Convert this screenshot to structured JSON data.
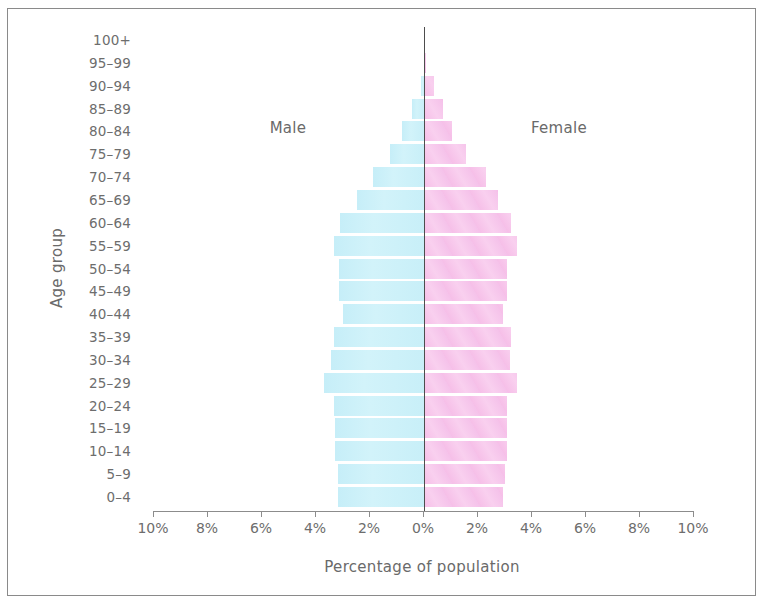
{
  "chart_data": {
    "type": "bar",
    "subtype": "population-pyramid",
    "title": "",
    "xlabel": "Percentage of population",
    "ylabel": "Age group",
    "xlim": [
      -10,
      10
    ],
    "x_ticks": [
      "10%",
      "8%",
      "6%",
      "4%",
      "2%",
      "0%",
      "2%",
      "4%",
      "6%",
      "8%",
      "10%"
    ],
    "grid": false,
    "legend": {
      "position": "inline",
      "entries": [
        "Male",
        "Female"
      ]
    },
    "annotations": [
      {
        "text": "Male",
        "side": "left"
      },
      {
        "text": "Female",
        "side": "right"
      }
    ],
    "categories": [
      "100+",
      "95–99",
      "90–94",
      "85–89",
      "80–84",
      "75–79",
      "70–74",
      "65–69",
      "60–64",
      "55–59",
      "50–54",
      "45–49",
      "40–44",
      "35–39",
      "30–34",
      "25–29",
      "20–24",
      "15–19",
      "10–14",
      "5–9",
      "0–4"
    ],
    "series": [
      {
        "name": "Male",
        "color": "#c9eef7",
        "values": [
          0,
          0,
          0.1,
          0.45,
          0.8,
          1.25,
          1.9,
          2.5,
          3.1,
          3.35,
          3.15,
          3.15,
          3.0,
          3.35,
          3.45,
          3.7,
          3.35,
          3.3,
          3.3,
          3.2,
          3.2
        ]
      },
      {
        "name": "Female",
        "color": "#f7c5ea",
        "values": [
          0,
          0.05,
          0.35,
          0.65,
          1.0,
          1.5,
          2.25,
          2.7,
          3.2,
          3.4,
          3.05,
          3.05,
          2.9,
          3.2,
          3.15,
          3.4,
          3.05,
          3.05,
          3.05,
          2.95,
          2.9
        ]
      }
    ]
  },
  "labels": {
    "male": "Male",
    "female": "Female",
    "xlabel": "Percentage of population",
    "ylabel": "Age group"
  }
}
